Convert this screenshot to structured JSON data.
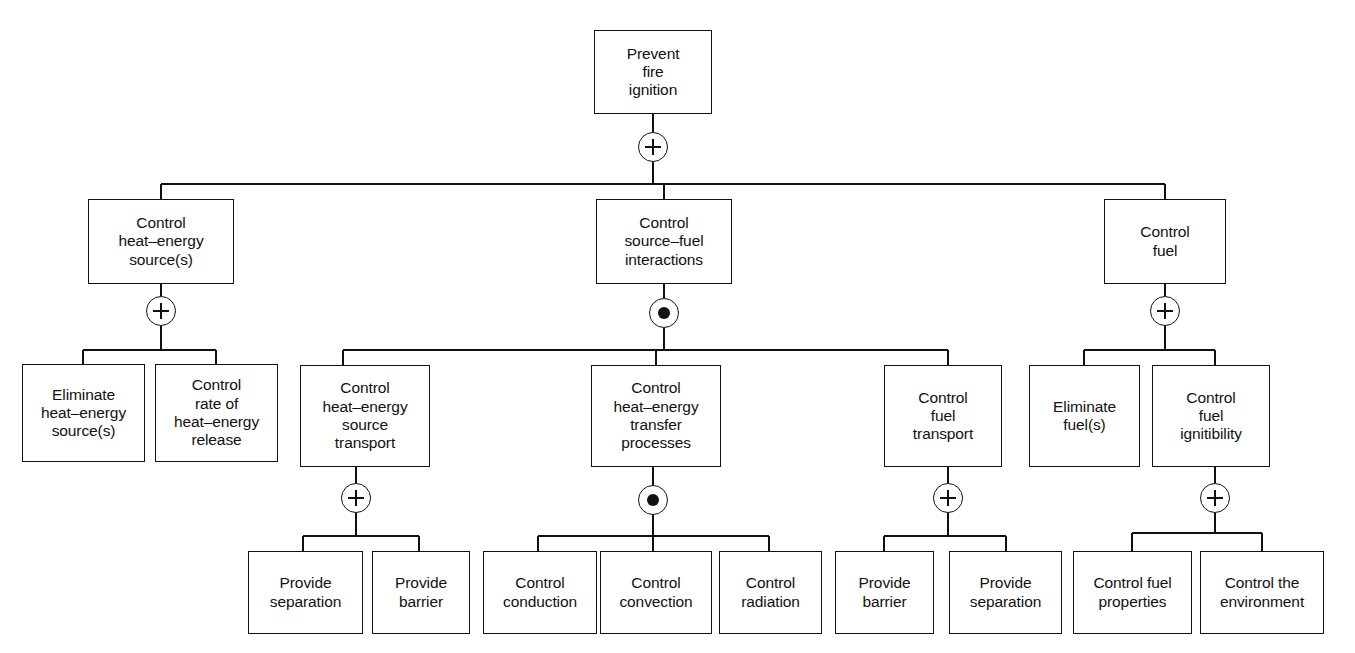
{
  "diagram": {
    "type": "fault-tree",
    "stroke_color": "#111111",
    "background_color": "#ffffff",
    "gate_types": {
      "or": "+",
      "and": "dot"
    }
  },
  "nodes": [
    {
      "id": "n0",
      "label": "Prevent\nfire\nignition",
      "level": 0,
      "x": 594,
      "y": 30,
      "w": 118,
      "h": 84,
      "gate": "or",
      "gate_cx": 653,
      "gate_cy": 147,
      "gate_r": 15
    },
    {
      "id": "n1",
      "label": "Control\nheat–energy\nsource(s)",
      "level": 1,
      "x": 88,
      "y": 199,
      "w": 146,
      "h": 85,
      "gate": "or",
      "gate_cx": 161,
      "gate_cy": 311,
      "gate_r": 15
    },
    {
      "id": "n2",
      "label": "Control\nsource–fuel\ninteractions",
      "level": 1,
      "x": 596,
      "y": 199,
      "w": 136,
      "h": 85,
      "gate": "and",
      "gate_cx": 664,
      "gate_cy": 313,
      "gate_r": 15
    },
    {
      "id": "n3",
      "label": "Control\nfuel",
      "level": 1,
      "x": 1104,
      "y": 199,
      "w": 122,
      "h": 85,
      "gate": "or",
      "gate_cx": 1165,
      "gate_cy": 311,
      "gate_r": 15
    },
    {
      "id": "n4",
      "label": "Eliminate\nheat–energy\nsource(s)",
      "level": 2,
      "x": 22,
      "y": 364,
      "w": 123,
      "h": 98,
      "gate": null
    },
    {
      "id": "n5",
      "label": "Control\nrate of\nheat–energy\nrelease",
      "level": 2,
      "x": 155,
      "y": 364,
      "w": 123,
      "h": 98,
      "gate": null
    },
    {
      "id": "n6",
      "label": "Control\nheat–energy\nsource\ntransport",
      "level": 2,
      "x": 300,
      "y": 365,
      "w": 130,
      "h": 102,
      "gate": "or",
      "gate_cx": 356,
      "gate_cy": 498,
      "gate_r": 15
    },
    {
      "id": "n7",
      "label": "Control\nheat–energy\ntransfer\nprocesses",
      "level": 2,
      "x": 591,
      "y": 365,
      "w": 130,
      "h": 102,
      "gate": "and",
      "gate_cx": 653,
      "gate_cy": 500,
      "gate_r": 15
    },
    {
      "id": "n8",
      "label": "Control\nfuel\ntransport",
      "level": 2,
      "x": 884,
      "y": 365,
      "w": 118,
      "h": 102,
      "gate": "or",
      "gate_cx": 948,
      "gate_cy": 498,
      "gate_r": 15
    },
    {
      "id": "n9",
      "label": "Eliminate\nfuel(s)",
      "level": 2,
      "x": 1029,
      "y": 365,
      "w": 111,
      "h": 102,
      "gate": null
    },
    {
      "id": "n10",
      "label": "Control\nfuel\nignitibility",
      "level": 2,
      "x": 1152,
      "y": 365,
      "w": 118,
      "h": 102,
      "gate": "or",
      "gate_cx": 1215,
      "gate_cy": 498,
      "gate_r": 15
    },
    {
      "id": "n11",
      "label": "Provide\nseparation",
      "level": 3,
      "x": 248,
      "y": 551,
      "w": 115,
      "h": 83,
      "gate": null
    },
    {
      "id": "n12",
      "label": "Provide\nbarrier",
      "level": 3,
      "x": 372,
      "y": 551,
      "w": 98,
      "h": 83,
      "gate": null
    },
    {
      "id": "n13",
      "label": "Control\nconduction",
      "level": 3,
      "x": 483,
      "y": 551,
      "w": 114,
      "h": 83,
      "gate": null
    },
    {
      "id": "n14",
      "label": "Control\nconvection",
      "level": 3,
      "x": 600,
      "y": 551,
      "w": 112,
      "h": 83,
      "gate": null
    },
    {
      "id": "n15",
      "label": "Control\nradiation",
      "level": 3,
      "x": 719,
      "y": 551,
      "w": 103,
      "h": 83,
      "gate": null
    },
    {
      "id": "n16",
      "label": "Provide\nbarrier",
      "level": 3,
      "x": 835,
      "y": 551,
      "w": 99,
      "h": 83,
      "gate": null
    },
    {
      "id": "n17",
      "label": "Provide\nseparation",
      "level": 3,
      "x": 949,
      "y": 551,
      "w": 113,
      "h": 83,
      "gate": null
    },
    {
      "id": "n18",
      "label": "Control fuel\nproperties",
      "level": 3,
      "x": 1073,
      "y": 551,
      "w": 119,
      "h": 83,
      "gate": null
    },
    {
      "id": "n19",
      "label": "Control the\nenvironment",
      "level": 3,
      "x": 1200,
      "y": 551,
      "w": 124,
      "h": 83,
      "gate": null
    }
  ],
  "edges": {
    "segments": [
      {
        "name": "root-stem-to-gate",
        "x1": 653,
        "y1": 114,
        "x2": 653,
        "y2": 132
      },
      {
        "name": "root-gate-to-bus",
        "x1": 653,
        "y1": 162,
        "x2": 653,
        "y2": 184
      },
      {
        "name": "level1-bus",
        "x1": 161,
        "y1": 184,
        "x2": 1165,
        "y2": 184
      },
      {
        "name": "drop-to-n1",
        "x1": 161,
        "y1": 184,
        "x2": 161,
        "y2": 199
      },
      {
        "name": "drop-to-n2",
        "x1": 664,
        "y1": 184,
        "x2": 664,
        "y2": 199
      },
      {
        "name": "drop-to-n3",
        "x1": 1165,
        "y1": 184,
        "x2": 1165,
        "y2": 199
      },
      {
        "name": "n1-stem",
        "x1": 161,
        "y1": 284,
        "x2": 161,
        "y2": 296
      },
      {
        "name": "n1-gate-drop",
        "x1": 161,
        "y1": 326,
        "x2": 161,
        "y2": 350
      },
      {
        "name": "n1-bus",
        "x1": 83,
        "y1": 350,
        "x2": 216,
        "y2": 350
      },
      {
        "name": "n1-drop-a",
        "x1": 83,
        "y1": 350,
        "x2": 83,
        "y2": 364
      },
      {
        "name": "n1-drop-b",
        "x1": 216,
        "y1": 350,
        "x2": 216,
        "y2": 364
      },
      {
        "name": "n2-stem",
        "x1": 664,
        "y1": 284,
        "x2": 664,
        "y2": 298
      },
      {
        "name": "n2-gate-drop",
        "x1": 664,
        "y1": 328,
        "x2": 664,
        "y2": 350
      },
      {
        "name": "n2-bus",
        "x1": 343,
        "y1": 350,
        "x2": 948,
        "y2": 350
      },
      {
        "name": "n2-drop-a",
        "x1": 343,
        "y1": 350,
        "x2": 343,
        "y2": 365
      },
      {
        "name": "n2-drop-b",
        "x1": 656,
        "y1": 350,
        "x2": 656,
        "y2": 365
      },
      {
        "name": "n2-drop-c",
        "x1": 948,
        "y1": 350,
        "x2": 948,
        "y2": 365
      },
      {
        "name": "n3-stem",
        "x1": 1165,
        "y1": 284,
        "x2": 1165,
        "y2": 296
      },
      {
        "name": "n3-gate-drop",
        "x1": 1165,
        "y1": 326,
        "x2": 1165,
        "y2": 350
      },
      {
        "name": "n3-bus",
        "x1": 1084,
        "y1": 350,
        "x2": 1215,
        "y2": 350
      },
      {
        "name": "n3-drop-a",
        "x1": 1084,
        "y1": 350,
        "x2": 1084,
        "y2": 365
      },
      {
        "name": "n3-drop-b",
        "x1": 1215,
        "y1": 350,
        "x2": 1215,
        "y2": 365
      },
      {
        "name": "n6-stem",
        "x1": 356,
        "y1": 467,
        "x2": 356,
        "y2": 483
      },
      {
        "name": "n6-gate-drop",
        "x1": 356,
        "y1": 513,
        "x2": 356,
        "y2": 536
      },
      {
        "name": "n6-bus",
        "x1": 303,
        "y1": 536,
        "x2": 419,
        "y2": 536
      },
      {
        "name": "n6-drop-a",
        "x1": 303,
        "y1": 536,
        "x2": 303,
        "y2": 551
      },
      {
        "name": "n6-drop-b",
        "x1": 419,
        "y1": 536,
        "x2": 419,
        "y2": 551
      },
      {
        "name": "n7-stem",
        "x1": 653,
        "y1": 467,
        "x2": 653,
        "y2": 485
      },
      {
        "name": "n7-gate-drop",
        "x1": 653,
        "y1": 515,
        "x2": 653,
        "y2": 536
      },
      {
        "name": "n7-bus",
        "x1": 538,
        "y1": 536,
        "x2": 769,
        "y2": 536
      },
      {
        "name": "n7-drop-a",
        "x1": 538,
        "y1": 536,
        "x2": 538,
        "y2": 551
      },
      {
        "name": "n7-drop-b",
        "x1": 653,
        "y1": 536,
        "x2": 653,
        "y2": 551
      },
      {
        "name": "n7-drop-c",
        "x1": 769,
        "y1": 536,
        "x2": 769,
        "y2": 551
      },
      {
        "name": "n8-stem",
        "x1": 948,
        "y1": 467,
        "x2": 948,
        "y2": 483
      },
      {
        "name": "n8-gate-drop",
        "x1": 948,
        "y1": 513,
        "x2": 948,
        "y2": 536
      },
      {
        "name": "n8-bus",
        "x1": 884,
        "y1": 536,
        "x2": 1006,
        "y2": 536
      },
      {
        "name": "n8-drop-a",
        "x1": 884,
        "y1": 536,
        "x2": 884,
        "y2": 551
      },
      {
        "name": "n8-drop-b",
        "x1": 1006,
        "y1": 536,
        "x2": 1006,
        "y2": 551
      },
      {
        "name": "n10-stem",
        "x1": 1215,
        "y1": 467,
        "x2": 1215,
        "y2": 483
      },
      {
        "name": "n10-gate-drop",
        "x1": 1215,
        "y1": 513,
        "x2": 1215,
        "y2": 533
      },
      {
        "name": "n10-bus",
        "x1": 1132,
        "y1": 533,
        "x2": 1262,
        "y2": 533
      },
      {
        "name": "n10-drop-a",
        "x1": 1132,
        "y1": 533,
        "x2": 1132,
        "y2": 551
      },
      {
        "name": "n10-drop-b",
        "x1": 1262,
        "y1": 533,
        "x2": 1262,
        "y2": 551
      }
    ]
  }
}
